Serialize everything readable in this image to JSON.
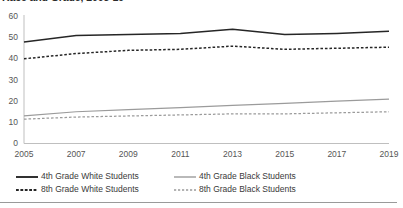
{
  "chart_title": "Race and Grade, 2005-19",
  "axes": {
    "y_ticks": [
      "0",
      "10",
      "20",
      "30",
      "40",
      "50",
      "60"
    ],
    "x_ticks": [
      "2005",
      "2007",
      "2009",
      "2011",
      "2013",
      "2015",
      "2017",
      "2019"
    ]
  },
  "legend": {
    "items": [
      {
        "label": "4th Grade White Students",
        "swatch": "solid-black-line-swatch"
      },
      {
        "label": "4th Grade Black Students",
        "swatch": "solid-gray-line-swatch"
      },
      {
        "label": "8th Grade White Students",
        "swatch": "dashed-black-line-swatch"
      },
      {
        "label": "8th Grade Black Students",
        "swatch": "dashed-gray-line-swatch"
      }
    ]
  },
  "colors": {
    "black_series": "#262626",
    "gray_series": "#9b9b9b",
    "axis": "#bfbfbf",
    "tick_text": "#565656",
    "rule": "#9a9a9a"
  },
  "chart_data": {
    "type": "line",
    "title": "Race and Grade, 2005-19",
    "xlabel": "",
    "ylabel": "",
    "x": [
      2005,
      2007,
      2009,
      2011,
      2013,
      2015,
      2017,
      2019
    ],
    "categories": [
      "2005",
      "2007",
      "2009",
      "2011",
      "2013",
      "2015",
      "2017",
      "2019"
    ],
    "xlim": [
      2005,
      2019
    ],
    "ylim": [
      0,
      60
    ],
    "y_ticks": [
      0,
      10,
      20,
      30,
      40,
      50,
      60
    ],
    "grid": false,
    "legend_position": "bottom",
    "series": [
      {
        "name": "4th Grade White Students",
        "color": "#262626",
        "style": "solid",
        "values": [
          48,
          51,
          51.5,
          52,
          54,
          51.5,
          52,
          53
        ]
      },
      {
        "name": "4th Grade Black Students",
        "color": "#9b9b9b",
        "style": "solid",
        "values": [
          13,
          15,
          16,
          17,
          18,
          19,
          20,
          21
        ]
      },
      {
        "name": "8th Grade White Students",
        "color": "#262626",
        "style": "dashed",
        "values": [
          40,
          42.5,
          44,
          44.5,
          46,
          44.5,
          45,
          45.5
        ]
      },
      {
        "name": "8th Grade Black Students",
        "color": "#9b9b9b",
        "style": "dashed",
        "values": [
          11.5,
          12.5,
          13,
          13.5,
          14,
          14,
          14.5,
          15
        ]
      }
    ]
  }
}
